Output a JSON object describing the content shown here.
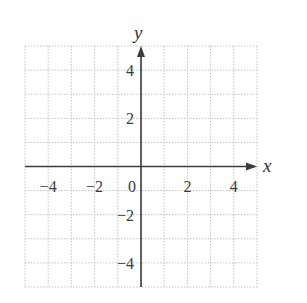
{
  "chart_data": {
    "type": "scatter",
    "title": "",
    "xlabel": "x",
    "ylabel": "y",
    "xlim": [
      -5,
      5
    ],
    "ylim": [
      -5,
      5
    ],
    "grid": true,
    "grid_step": 1,
    "x_ticks": [
      -4,
      -2,
      0,
      2,
      4
    ],
    "y_ticks": [
      4,
      2,
      -2,
      -4
    ],
    "x_tick_labels": [
      "−4",
      "−2",
      "0",
      "2",
      "4"
    ],
    "y_tick_labels": [
      "4",
      "2",
      "−2",
      "−4"
    ],
    "series": [],
    "legend": null
  },
  "colors": {
    "grid": "#c4c4c4",
    "axis": "#3c3c3c",
    "text": "#3a3a3a"
  }
}
